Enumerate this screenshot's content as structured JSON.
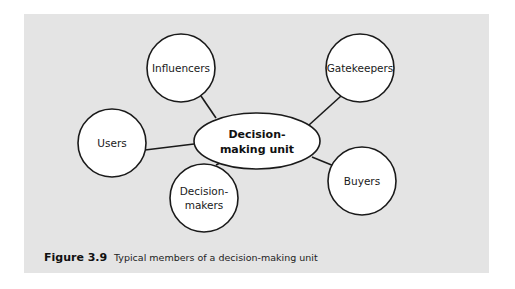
{
  "diagram": {
    "hub": {
      "label_line1": "Decision-",
      "label_line2": "making unit"
    },
    "nodes": [
      {
        "id": "influencers",
        "line1": "Influencers",
        "line2": ""
      },
      {
        "id": "gatekeepers",
        "line1": "Gatekeepers",
        "line2": ""
      },
      {
        "id": "users",
        "line1": "Users",
        "line2": ""
      },
      {
        "id": "buyers",
        "line1": "Buyers",
        "line2": ""
      },
      {
        "id": "decision-makers",
        "line1": "Decision-",
        "line2": "makers"
      }
    ],
    "colors": {
      "panel_background": "#e4e4e4",
      "node_fill": "#ffffff",
      "stroke": "#1a1a1a"
    }
  },
  "caption": {
    "figure_number": "Figure 3.9",
    "text": "Typical members of a decision-making unit"
  }
}
